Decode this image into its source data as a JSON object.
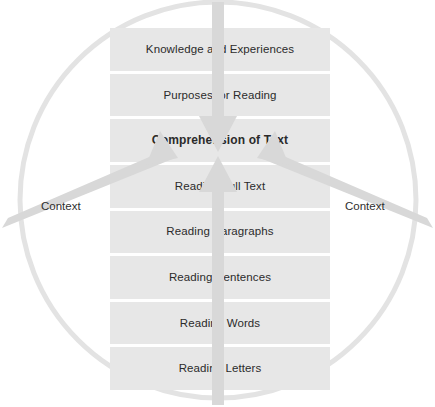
{
  "diagram": {
    "shape": "circle-with-stacked-bars",
    "colors": {
      "bar_fill": "#e7e7e7",
      "bar_fill_alt": "#e4e4e4",
      "circle_stroke": "#e2e2e2",
      "arrow_fill": "#dcdcdc",
      "text": "#2b2b2b",
      "background": "#ffffff"
    },
    "bars": [
      {
        "label": "Knowledge and Experiences",
        "emphasis": "normal"
      },
      {
        "label": "Purposes for Reading",
        "emphasis": "normal"
      },
      {
        "label": "Comprehension of Text",
        "emphasis": "bold"
      },
      {
        "label": "Reading Full Text",
        "emphasis": "normal"
      },
      {
        "label": "Reading Paragraphs",
        "emphasis": "normal"
      },
      {
        "label": "Reading Sentences",
        "emphasis": "normal"
      },
      {
        "label": "Reading Words",
        "emphasis": "normal"
      },
      {
        "label": "Reading Letters",
        "emphasis": "normal"
      }
    ],
    "context_labels": {
      "left": "Context",
      "right": "Context"
    },
    "arrows": [
      {
        "name": "top-down-arrow",
        "from": "Knowledge and Experiences",
        "to": "Comprehension of Text",
        "direction": "down"
      },
      {
        "name": "bottom-up-arrow",
        "from": "Reading Letters",
        "to": "Comprehension of Text",
        "direction": "up"
      },
      {
        "name": "left-context-arrow",
        "from": "Context",
        "to": "Comprehension of Text",
        "direction": "up-right"
      },
      {
        "name": "right-context-arrow",
        "from": "Context",
        "to": "Comprehension of Text",
        "direction": "up-left"
      }
    ]
  }
}
